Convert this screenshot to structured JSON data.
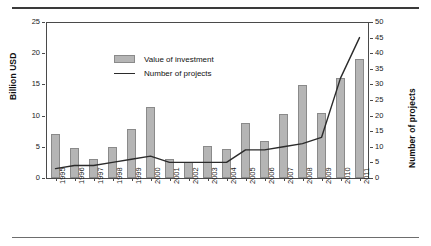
{
  "chart_data": {
    "type": "bar",
    "title": "",
    "subtitle": "",
    "xlabel": "",
    "ylabel": "Billion USD",
    "y2label": "Number of projects",
    "categories": [
      "1995",
      "1996",
      "1997",
      "1998",
      "1999",
      "2000",
      "2001",
      "2002",
      "2003",
      "2004",
      "2005",
      "2006",
      "2007",
      "2008",
      "2009",
      "2010",
      "2011"
    ],
    "series": [
      {
        "name": "Value of investment",
        "kind": "bar",
        "axis": "left",
        "unit": "Billion USD",
        "color": "#b5b5b5",
        "values": [
          7.0,
          4.8,
          3.0,
          5.0,
          7.8,
          11.4,
          3.0,
          2.5,
          5.1,
          4.7,
          8.8,
          5.9,
          10.2,
          14.9,
          10.4,
          16.0,
          19.0
        ]
      },
      {
        "name": "Number of projects",
        "kind": "line",
        "axis": "right",
        "unit": "projects",
        "color": "#2b2b2b",
        "values": [
          3,
          4,
          4,
          5,
          6,
          7,
          5,
          5,
          5,
          5,
          9,
          9,
          10,
          11,
          13,
          32,
          45
        ]
      }
    ],
    "ylim": [
      0,
      25
    ],
    "yticks": [
      0,
      5,
      10,
      15,
      20,
      25
    ],
    "y2lim": [
      0,
      50
    ],
    "y2ticks": [
      0,
      5,
      10,
      15,
      20,
      25,
      30,
      35,
      40,
      45,
      50
    ],
    "grid": false,
    "legend_position": "top-left",
    "legend": [
      "Value of investment",
      "Number of projects"
    ]
  },
  "figure": {
    "rule_top": "",
    "rule_bottom": ""
  }
}
